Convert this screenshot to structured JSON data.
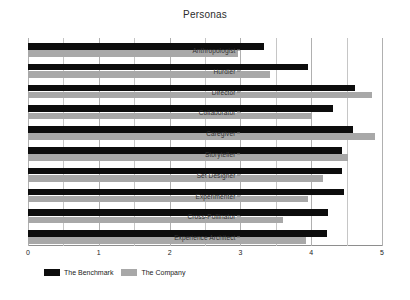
{
  "chart_data": {
    "type": "bar",
    "orientation": "horizontal",
    "title": "Personas",
    "xlabel": "",
    "ylabel": "",
    "xlim": [
      0,
      5
    ],
    "xticks": [
      0,
      1,
      2,
      3,
      4,
      5
    ],
    "xtick_labels": [
      "0",
      "1",
      "2",
      "3",
      "4",
      "5"
    ],
    "minor_gridlines": [
      0.5,
      1.5,
      2.5,
      3.5,
      4.5
    ],
    "grid": true,
    "legend_position": "bottom-left",
    "categories": [
      "Anthropologist",
      "Hurdler",
      "Director",
      "Collaborator",
      "Caregiver",
      "Storyteller",
      "Set Designer",
      "Experimenter",
      "Cross-Pollinator",
      "Experience Architect"
    ],
    "series": [
      {
        "name": "The Benchmark",
        "color": "#0d0d0d",
        "values": [
          3.33,
          3.95,
          4.62,
          4.31,
          4.59,
          4.44,
          4.44,
          4.46,
          4.24,
          4.22
        ]
      },
      {
        "name": "The Company",
        "color": "#a8a8a8",
        "values": [
          2.97,
          3.42,
          4.86,
          4.01,
          4.9,
          4.52,
          4.17,
          3.95,
          3.6,
          3.93
        ]
      }
    ]
  },
  "legend": {
    "items": [
      {
        "label": "The Benchmark",
        "color": "#0d0d0d"
      },
      {
        "label": "The Company",
        "color": "#a8a8a8"
      }
    ]
  }
}
